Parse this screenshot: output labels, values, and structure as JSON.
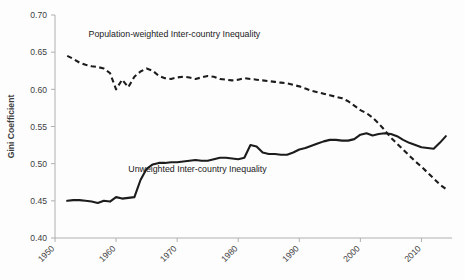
{
  "chart_data": {
    "type": "line",
    "title": "",
    "xlabel": "",
    "ylabel": "Gini Coefficient",
    "xlim": [
      1950,
      2015
    ],
    "ylim": [
      0.4,
      0.7
    ],
    "grid": false,
    "legend_position": "inline-annotation",
    "xticks": [
      1950,
      1960,
      1970,
      1980,
      1990,
      2000,
      2010
    ],
    "xtick_labels": [
      "1950",
      "1960",
      "1970",
      "1980",
      "1990",
      "2000",
      "2010"
    ],
    "yticks": [
      0.4,
      0.45,
      0.5,
      0.55,
      0.6,
      0.65,
      0.7
    ],
    "ytick_labels": [
      "0.40",
      "0.45",
      "0.50",
      "0.55",
      "0.60",
      "0.65",
      "0.70"
    ],
    "annotations": [
      {
        "name": "population-weighted-label",
        "text": "Population-weighted Inter-country Inequality",
        "x": 1955.5,
        "y": 0.6705
      },
      {
        "name": "unweighted-label",
        "text": "Unweighted Inter-country Inequality",
        "x": 1962.0,
        "y": 0.4885
      }
    ],
    "series": [
      {
        "name": "Population-weighted Inter-country Inequality",
        "style": "dashed",
        "color": "#1c1c1c",
        "x": [
          1952,
          1953,
          1954,
          1955,
          1956,
          1957,
          1958,
          1959,
          1960,
          1961,
          1962,
          1963,
          1964,
          1965,
          1966,
          1967,
          1968,
          1969,
          1970,
          1971,
          1972,
          1973,
          1974,
          1975,
          1976,
          1977,
          1978,
          1979,
          1980,
          1981,
          1982,
          1983,
          1984,
          1985,
          1986,
          1987,
          1988,
          1989,
          1990,
          1991,
          1992,
          1993,
          1994,
          1995,
          1996,
          1997,
          1998,
          1999,
          2000,
          2001,
          2002,
          2003,
          2004,
          2005,
          2006,
          2007,
          2008,
          2009,
          2010,
          2011,
          2012,
          2013,
          2014
        ],
        "values": [
          0.645,
          0.641,
          0.636,
          0.633,
          0.631,
          0.63,
          0.628,
          0.622,
          0.6,
          0.613,
          0.603,
          0.617,
          0.624,
          0.628,
          0.625,
          0.618,
          0.615,
          0.614,
          0.616,
          0.617,
          0.616,
          0.614,
          0.616,
          0.618,
          0.617,
          0.614,
          0.613,
          0.612,
          0.613,
          0.615,
          0.614,
          0.613,
          0.612,
          0.611,
          0.61,
          0.609,
          0.608,
          0.606,
          0.604,
          0.601,
          0.598,
          0.596,
          0.594,
          0.592,
          0.59,
          0.588,
          0.584,
          0.578,
          0.572,
          0.568,
          0.562,
          0.554,
          0.545,
          0.535,
          0.527,
          0.519,
          0.511,
          0.503,
          0.496,
          0.488,
          0.48,
          0.472,
          0.466
        ]
      },
      {
        "name": "Unweighted Inter-country Inequality",
        "style": "solid",
        "color": "#1c1c1c",
        "x": [
          1952,
          1953,
          1954,
          1955,
          1956,
          1957,
          1958,
          1959,
          1960,
          1961,
          1962,
          1963,
          1964,
          1965,
          1966,
          1967,
          1968,
          1969,
          1970,
          1971,
          1972,
          1973,
          1974,
          1975,
          1976,
          1977,
          1978,
          1979,
          1980,
          1981,
          1982,
          1983,
          1984,
          1985,
          1986,
          1987,
          1988,
          1989,
          1990,
          1991,
          1992,
          1993,
          1994,
          1995,
          1996,
          1997,
          1998,
          1999,
          2000,
          2001,
          2002,
          2003,
          2004,
          2005,
          2006,
          2007,
          2008,
          2009,
          2010,
          2011,
          2012,
          2013,
          2014
        ],
        "values": [
          0.45,
          0.451,
          0.451,
          0.45,
          0.449,
          0.447,
          0.45,
          0.449,
          0.455,
          0.453,
          0.454,
          0.455,
          0.478,
          0.493,
          0.499,
          0.501,
          0.501,
          0.502,
          0.502,
          0.503,
          0.504,
          0.505,
          0.504,
          0.504,
          0.506,
          0.508,
          0.508,
          0.507,
          0.506,
          0.508,
          0.525,
          0.523,
          0.515,
          0.513,
          0.513,
          0.512,
          0.512,
          0.515,
          0.519,
          0.521,
          0.524,
          0.527,
          0.53,
          0.532,
          0.532,
          0.531,
          0.531,
          0.533,
          0.539,
          0.541,
          0.538,
          0.54,
          0.541,
          0.54,
          0.537,
          0.532,
          0.528,
          0.525,
          0.522,
          0.521,
          0.52,
          0.528,
          0.537
        ]
      }
    ]
  }
}
